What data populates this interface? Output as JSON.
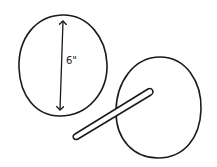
{
  "diagram": {
    "style": "hand-drawn sketch",
    "stroke_color": "#1a1a1a",
    "background": "#ffffff",
    "circle_measured": {
      "dimension_label": "6\"",
      "dimension": "diameter"
    },
    "circle_with_stick": {
      "description": "circle with a rod/stick passing across it"
    }
  }
}
